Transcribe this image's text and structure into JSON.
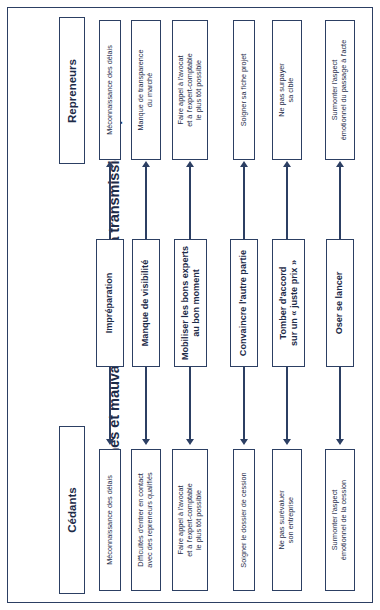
{
  "document": {
    "title": "Les bonnes et mauvaises attitudes de la transmission-reprise",
    "accent_color": "#2c3f63",
    "text_color": "#1d2b48",
    "background_color": "#ffffff"
  },
  "sections": {
    "top_header": "Repreneurs",
    "bottom_header": "Cédants"
  },
  "rows": [
    {
      "center": "Impréparation",
      "repreneurs": "Méconnaissance des délais",
      "cedants": "Méconnaissance des délais"
    },
    {
      "center": "Manque de visibilité",
      "repreneurs": "Manque de transparence\ndu marché",
      "cedants": "Difficultés d'entrer en contact\navec des repreneurs qualifiés"
    },
    {
      "center": "Mobiliser les bons experts\nau bon moment",
      "repreneurs": "Faire appel à l'avocat\net à l'expert-comptable\nle plus tôt possible",
      "cedants": "Faire appel à l'avocat\net à l'expert-comptable\nle plus tôt possible"
    },
    {
      "center": "Convaincre l'autre partie",
      "repreneurs": "Soigner sa fiche projet",
      "cedants": "Soigner le dossier de cession"
    },
    {
      "center": "Tomber d'accord\nsur un « juste prix »",
      "repreneurs": "Ne pas surpayer\nsa cible",
      "cedants": "Ne pas surévaluer\nson entreprise"
    },
    {
      "center": "Oser se lancer",
      "repreneurs": "Surmonter l'aspect\némotionnel du passage à l'acte",
      "cedants": "Surmonter l'aspect\némotionnel de la cession"
    }
  ],
  "chart_data": {
    "type": "diagram",
    "orientation": "rotated-90",
    "title": "Les bonnes et mauvaises attitudes de la transmission-reprise",
    "columns": [
      "Repreneurs",
      "Attitude",
      "Cédants"
    ],
    "arrow_direction": "center-to-both-sides",
    "node_count": 18
  }
}
